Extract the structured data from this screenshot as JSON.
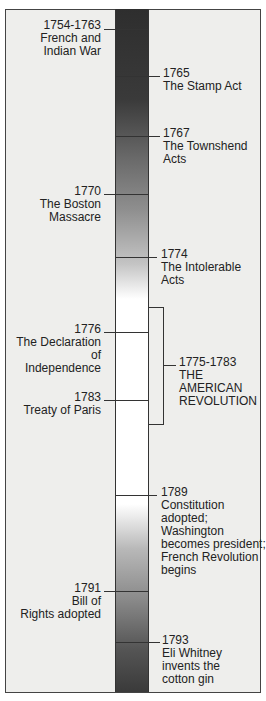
{
  "events": [
    {
      "side": "left",
      "year": "1754-1763",
      "lines": [
        "French and",
        "Indian War"
      ]
    },
    {
      "side": "right",
      "year": "1765",
      "lines": [
        "The Stamp Act"
      ]
    },
    {
      "side": "right",
      "year": "1767",
      "lines": [
        "The Townshend",
        "Acts"
      ]
    },
    {
      "side": "left",
      "year": "1770",
      "lines": [
        "The Boston",
        "Massacre"
      ]
    },
    {
      "side": "right",
      "year": "1774",
      "lines": [
        "The Intolerable",
        "Acts"
      ]
    },
    {
      "side": "left",
      "year": "1776",
      "lines": [
        "The Declaration",
        "of",
        "Independence"
      ]
    },
    {
      "side": "left",
      "year": "1783",
      "lines": [
        "Treaty of Paris"
      ]
    },
    {
      "side": "right",
      "year": "1789",
      "lines": [
        "Constitution",
        "adopted;",
        "Washington",
        "becomes president;",
        "French Revolution",
        "begins"
      ]
    },
    {
      "side": "left",
      "year": "1791",
      "lines": [
        "Bill of",
        "Rights adopted"
      ]
    },
    {
      "side": "right",
      "year": "1793",
      "lines": [
        "Eli Whitney",
        "invents the",
        "cotton gin"
      ]
    }
  ],
  "period": {
    "year": "1775-1783",
    "lines": [
      "THE",
      "AMERICAN",
      "REVOLUTION"
    ]
  },
  "colors": {
    "bar_dark": "#2e2e2e",
    "bar_light": "#ffffff",
    "frame_bg": "#eeeeec",
    "line": "#333333"
  }
}
